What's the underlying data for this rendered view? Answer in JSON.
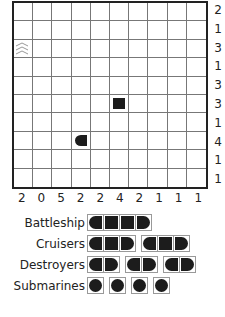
{
  "puzzle": {
    "rows": 10,
    "cols": 10,
    "row_clues": [
      "2",
      "1",
      "3",
      "1",
      "3",
      "3",
      "1",
      "4",
      "1",
      "1"
    ],
    "col_clues": [
      "2",
      "0",
      "5",
      "2",
      "2",
      "4",
      "2",
      "1",
      "1",
      "1"
    ],
    "given_cells": [
      {
        "row": 2,
        "col": 0,
        "type": "water",
        "icon": "wave-icon"
      },
      {
        "row": 5,
        "col": 5,
        "type": "middle",
        "icon": "ship-middle-icon"
      },
      {
        "row": 7,
        "col": 3,
        "type": "left",
        "icon": "ship-left-end-icon"
      }
    ]
  },
  "fleet": {
    "battleship": {
      "label": "Battleship",
      "count": 1,
      "length": 4
    },
    "cruisers": {
      "label": "Cruisers",
      "count": 2,
      "length": 3
    },
    "destroyers": {
      "label": "Destroyers",
      "count": 3,
      "length": 2
    },
    "submarines": {
      "label": "Submarines",
      "count": 4,
      "length": 1
    }
  },
  "colors": {
    "ship": "#1c1c1c",
    "grid_line": "#777777",
    "border": "#222222"
  }
}
